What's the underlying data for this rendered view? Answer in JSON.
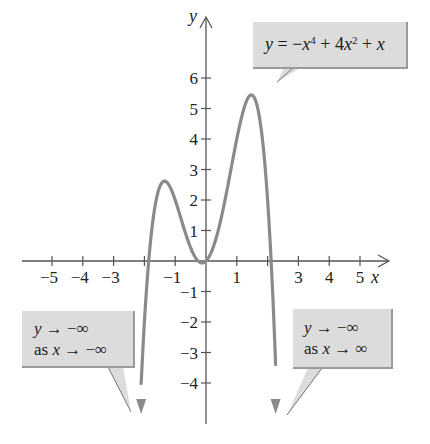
{
  "chart_data": {
    "type": "line",
    "title": "",
    "function": "y = -x^4 + 4x^2 + x",
    "xlabel": "x",
    "ylabel": "y",
    "xlim": [
      -6,
      6
    ],
    "ylim": [
      -5,
      7.5
    ],
    "x_ticks": [
      -5,
      -4,
      -3,
      -2,
      -1,
      1,
      2,
      3,
      4,
      5
    ],
    "x_tick_labels": [
      "−5",
      "−4",
      "−3",
      "−1",
      "1",
      "3",
      "4",
      "5"
    ],
    "y_ticks": [
      6,
      5,
      4,
      3,
      2,
      1,
      -1,
      -2,
      -3,
      -4
    ],
    "y_tick_labels": [
      "6",
      "5",
      "4",
      "3",
      "2",
      "1",
      "−1",
      "−2",
      "−3",
      "−4"
    ],
    "grid": false,
    "series": [
      {
        "name": "y = -x^4 + 4x^2 + x",
        "x": [
          -2.1,
          -2.0,
          -1.86,
          -1.6,
          -1.3,
          -1.0,
          -0.5,
          -0.13,
          0,
          0.5,
          1.0,
          1.47,
          1.8,
          2.11,
          2.2
        ],
        "y": [
          -4.0,
          -2.0,
          0.0,
          1.85,
          2.62,
          2.0,
          0.44,
          -0.06,
          0.0,
          1.44,
          4.0,
          5.4,
          3.28,
          0.0,
          -2.3
        ]
      }
    ],
    "annotations": [
      {
        "text": "y = −x⁴ + 4x² + x",
        "points_to": "local maximum near (1.47, 5.4)"
      },
      {
        "text": "y → −∞ as x → −∞",
        "points_to": "left end behavior arrow"
      },
      {
        "text": "y → −∞ as x → ∞",
        "points_to": "right end behavior arrow"
      }
    ],
    "colors": {
      "curve": "#8a8a8a",
      "axes": "#555555",
      "callout_fill": "#dcdcdc"
    }
  },
  "axes": {
    "x_name": "x",
    "y_name": "y",
    "x_labels": [
      {
        "v": -5,
        "t": "−5"
      },
      {
        "v": -4,
        "t": "−4"
      },
      {
        "v": -3,
        "t": "−3"
      },
      {
        "v": -1,
        "t": "−1"
      },
      {
        "v": 1,
        "t": "1"
      },
      {
        "v": 3,
        "t": "3"
      },
      {
        "v": 4,
        "t": "4"
      },
      {
        "v": 5,
        "t": "5"
      }
    ],
    "y_labels": [
      {
        "v": 6,
        "t": "6"
      },
      {
        "v": 5,
        "t": "5"
      },
      {
        "v": 4,
        "t": "4"
      },
      {
        "v": 3,
        "t": "3"
      },
      {
        "v": 2,
        "t": "2"
      },
      {
        "v": 1,
        "t": "1"
      },
      {
        "v": -1,
        "t": "−1"
      },
      {
        "v": -2,
        "t": "−2"
      },
      {
        "v": -3,
        "t": "−3"
      },
      {
        "v": -4,
        "t": "−4"
      }
    ]
  },
  "callouts": {
    "equation": {
      "y": "y",
      "eq": " = −",
      "x1": "x",
      "p1": "4",
      "plus1": " + 4",
      "x2": "x",
      "p2": "2",
      "plus2": " + ",
      "x3": "x"
    },
    "left": {
      "line1_var": "y",
      "line1_rest": " → −∞",
      "line2_as": "as ",
      "line2_var": "x",
      "line2_rest": " → −∞"
    },
    "right": {
      "line1_var": "y",
      "line1_rest": " → −∞",
      "line2_as": "as ",
      "line2_var": "x",
      "line2_rest": " → ∞"
    }
  }
}
